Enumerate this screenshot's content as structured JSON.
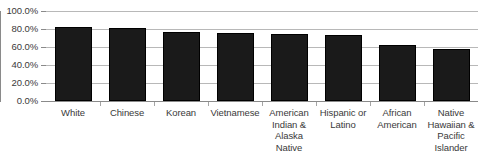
{
  "chart_data": {
    "type": "bar",
    "title": "",
    "subtitle": "",
    "xlabel": "",
    "ylabel": "",
    "categories": [
      "White",
      "Chinese",
      "Korean",
      "Vietnamese",
      "American Indian & Alaska Native",
      "Hispanic or Latino",
      "African American",
      "Native Hawaiian & Pacific Islander"
    ],
    "values": [
      82.0,
      81.0,
      76.5,
      76.0,
      74.0,
      73.5,
      62.0,
      58.0
    ],
    "ylim": [
      0,
      100
    ],
    "yticks": [
      0,
      20,
      40,
      60,
      80,
      100
    ],
    "ytick_labels": [
      "0.0%",
      "20.0%",
      "40.0%",
      "60.0%",
      "80.0%",
      "100.0%"
    ],
    "grid": true,
    "legend": "none",
    "bar_color": "#1a1a1a",
    "gridline_color": "#b8b8b8",
    "axis_color": "#8a8a8a",
    "text_color": "#3a3a3a"
  },
  "axis": {
    "y_tick_labels": [
      "100.0%",
      "80.0%",
      "60.0%",
      "40.0%",
      "20.0%",
      "0.0%"
    ],
    "x_category_labels": [
      "White",
      "Chinese",
      "Korean",
      "American Indian &\nAlaska\nNative",
      "Hispanic or\nLatino",
      "African\nAmerican",
      "Native\nHawaiian &\nPacific\nIslander"
    ]
  }
}
